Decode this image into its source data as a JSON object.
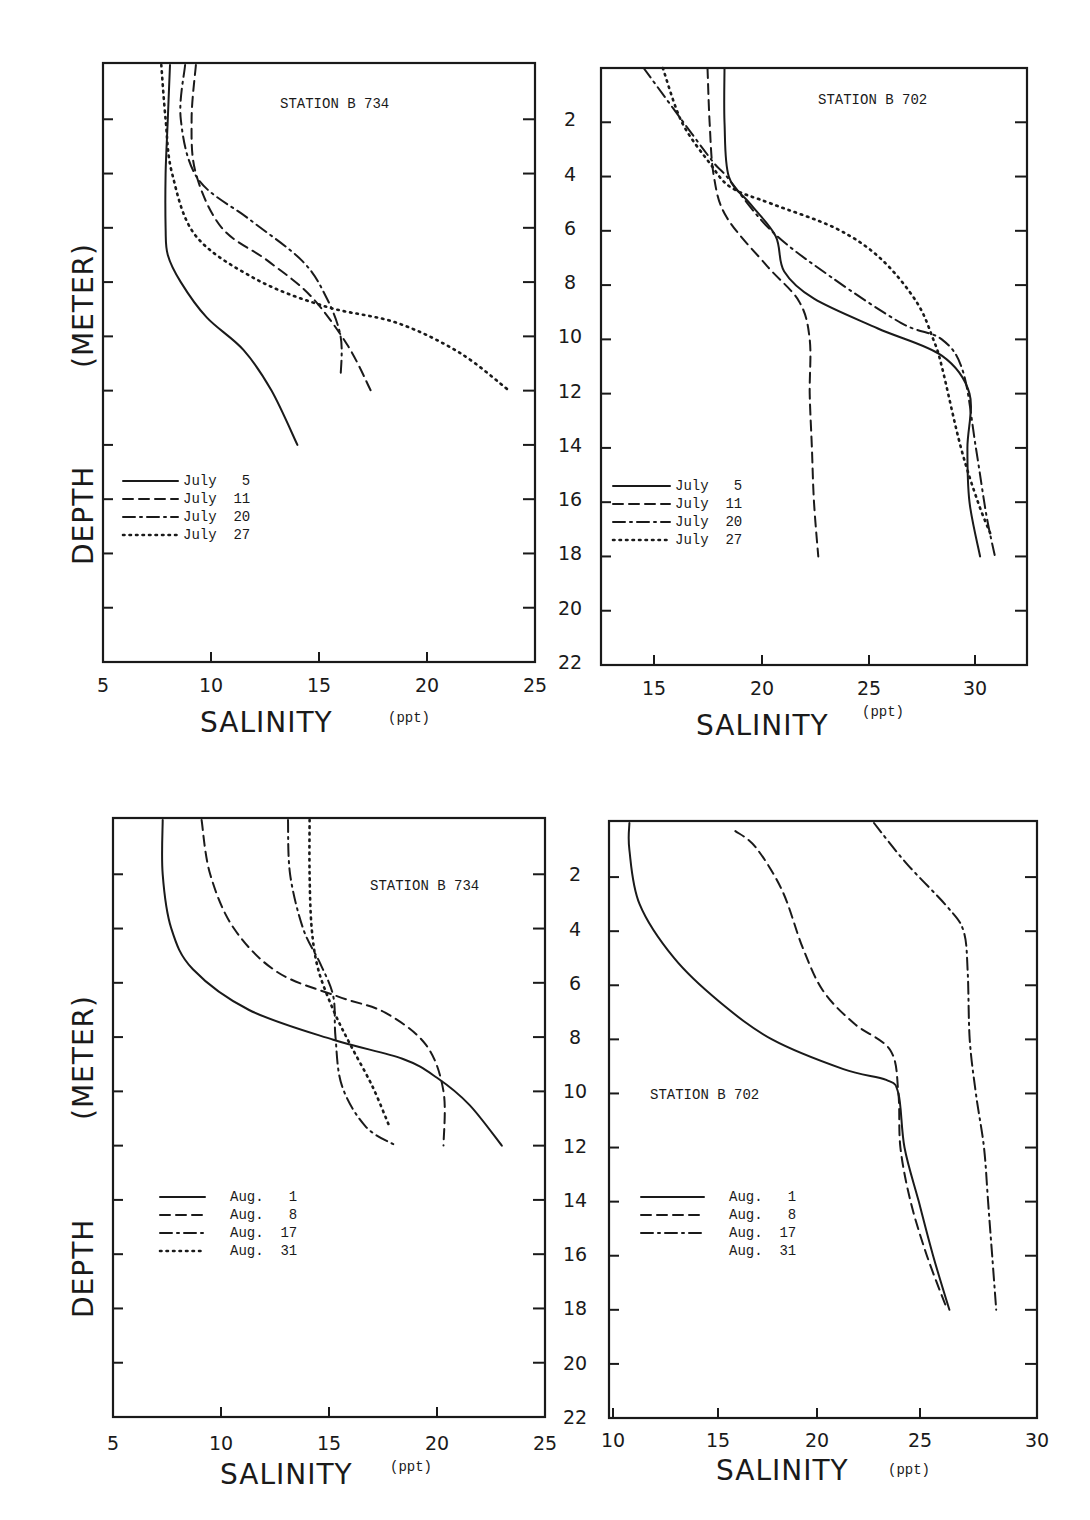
{
  "figure": {
    "y_axis_title": "DEPTH (METER)",
    "y_axis_title_parts": [
      "DEPTH",
      "(METER)"
    ],
    "shared_depth_ticks": [
      "2",
      "4",
      "6",
      "8",
      "10",
      "12",
      "14",
      "16",
      "18",
      "20",
      "22"
    ],
    "x_axis_title": "SALINITY",
    "x_axis_unit": "(ppt)"
  },
  "panels": [
    {
      "id": "top-left",
      "station_label": "STATION",
      "station_id": "B 734",
      "x_ticks": [
        "5",
        "10",
        "15",
        "20",
        "25"
      ],
      "legend": [
        {
          "label": "July",
          "day": "5",
          "style": "solid"
        },
        {
          "label": "July",
          "day": "11",
          "style": "dashed"
        },
        {
          "label": "July",
          "day": "20",
          "style": "dash-dot"
        },
        {
          "label": "July",
          "day": "27",
          "style": "dotted"
        }
      ]
    },
    {
      "id": "top-right",
      "station_label": "STATION",
      "station_id": "B 702",
      "x_ticks": [
        "15",
        "20",
        "25",
        "30"
      ],
      "legend": [
        {
          "label": "July",
          "day": "5",
          "style": "solid"
        },
        {
          "label": "July",
          "day": "11",
          "style": "dashed"
        },
        {
          "label": "July",
          "day": "20",
          "style": "dash-dot"
        },
        {
          "label": "July",
          "day": "27",
          "style": "dotted"
        }
      ]
    },
    {
      "id": "bottom-left",
      "station_label": "STATION",
      "station_id": "B 734",
      "x_ticks": [
        "5",
        "10",
        "15",
        "20",
        "25"
      ],
      "legend": [
        {
          "label": "Aug.",
          "day": "1",
          "style": "solid"
        },
        {
          "label": "Aug.",
          "day": "8",
          "style": "dashed"
        },
        {
          "label": "Aug.",
          "day": "17",
          "style": "dash-dot"
        },
        {
          "label": "Aug.",
          "day": "31",
          "style": "dotted"
        }
      ]
    },
    {
      "id": "bottom-right",
      "station_label": "STATION",
      "station_id": "B 702",
      "x_ticks": [
        "10",
        "15",
        "20",
        "25",
        "30"
      ],
      "legend": [
        {
          "label": "Aug.",
          "day": "1",
          "style": "solid"
        },
        {
          "label": "Aug.",
          "day": "8",
          "style": "dashed"
        },
        {
          "label": "Aug.",
          "day": "17",
          "style": "dash-dot"
        },
        {
          "label": "Aug.",
          "day": "31",
          "style": "none"
        }
      ]
    }
  ],
  "chart_data": [
    {
      "type": "line",
      "title": "STATION B 734 (July)",
      "xlabel": "SALINITY (ppt)",
      "ylabel": "DEPTH (METER)",
      "xlim": [
        5,
        25
      ],
      "ylim": [
        22,
        0
      ],
      "y_inverted": true,
      "grid": false,
      "legend_position": "lower-left",
      "series": [
        {
          "name": "July 5",
          "style": "solid",
          "points": [
            [
              8.1,
              0
            ],
            [
              8.0,
              2
            ],
            [
              7.9,
              4
            ],
            [
              7.9,
              6
            ],
            [
              8.0,
              7
            ],
            [
              8.6,
              8
            ],
            [
              9.8,
              9.3
            ],
            [
              11.5,
              10.5
            ],
            [
              12.8,
              12
            ],
            [
              14.0,
              14
            ]
          ]
        },
        {
          "name": "July 11",
          "style": "dashed",
          "points": [
            [
              9.3,
              0
            ],
            [
              9.1,
              2
            ],
            [
              9.3,
              4
            ],
            [
              10.5,
              6
            ],
            [
              12.6,
              7.2
            ],
            [
              14.6,
              8.5
            ],
            [
              16.3,
              10.3
            ],
            [
              17.4,
              12
            ]
          ]
        },
        {
          "name": "July 20",
          "style": "dash-dot",
          "points": [
            [
              8.8,
              0
            ],
            [
              8.6,
              2
            ],
            [
              9.4,
              4.2
            ],
            [
              11.8,
              5.7
            ],
            [
              14.2,
              7.2
            ],
            [
              15.3,
              8.5
            ],
            [
              16.0,
              10
            ],
            [
              16.0,
              11.5
            ]
          ]
        },
        {
          "name": "July 27",
          "style": "dotted",
          "points": [
            [
              7.7,
              0
            ],
            [
              7.9,
              2
            ],
            [
              8.2,
              4
            ],
            [
              9.3,
              6.3
            ],
            [
              12.1,
              7.9
            ],
            [
              15.3,
              8.9
            ],
            [
              18.6,
              9.5
            ],
            [
              21.5,
              10.6
            ],
            [
              23.8,
              12
            ]
          ]
        }
      ]
    },
    {
      "type": "line",
      "title": "STATION B 702 (July)",
      "xlabel": "SALINITY (ppt)",
      "ylabel": "DEPTH (METER)",
      "xlim": [
        12.5,
        32.5
      ],
      "ylim": [
        22,
        0
      ],
      "y_inverted": true,
      "grid": false,
      "legend_position": "lower-left",
      "series": [
        {
          "name": "July 5",
          "style": "solid",
          "points": [
            [
              18.3,
              0
            ],
            [
              18.3,
              2
            ],
            [
              18.5,
              4
            ],
            [
              19.5,
              5
            ],
            [
              20.7,
              6.2
            ],
            [
              21.1,
              7.5
            ],
            [
              22.5,
              8.5
            ],
            [
              25.5,
              9.6
            ],
            [
              28.5,
              10.6
            ],
            [
              29.8,
              12
            ],
            [
              29.7,
              14
            ],
            [
              29.8,
              16
            ],
            [
              30.3,
              18
            ]
          ]
        },
        {
          "name": "July 11",
          "style": "dashed",
          "points": [
            [
              17.5,
              0
            ],
            [
              17.6,
              2
            ],
            [
              17.8,
              4
            ],
            [
              18.4,
              5.5
            ],
            [
              20.3,
              7.3
            ],
            [
              21.8,
              8.6
            ],
            [
              22.3,
              10
            ],
            [
              22.3,
              12
            ],
            [
              22.4,
              14
            ],
            [
              22.5,
              16
            ],
            [
              22.7,
              18
            ]
          ]
        },
        {
          "name": "July 20",
          "style": "dash-dot",
          "points": [
            [
              14.5,
              0
            ],
            [
              15.9,
              1.5
            ],
            [
              17.7,
              3.4
            ],
            [
              18.4,
              4
            ],
            [
              20.5,
              6
            ],
            [
              23.3,
              7.7
            ],
            [
              26.6,
              9.4
            ],
            [
              28.5,
              10
            ],
            [
              29.5,
              11.2
            ],
            [
              30.1,
              14
            ],
            [
              30.6,
              16.5
            ],
            [
              31.0,
              18
            ]
          ]
        },
        {
          "name": "July 27",
          "style": "dotted",
          "points": [
            [
              15.4,
              0
            ],
            [
              16.3,
              2
            ],
            [
              17.6,
              3.5
            ],
            [
              18.6,
              4.4
            ],
            [
              20.5,
              5
            ],
            [
              23.5,
              5.9
            ],
            [
              25.6,
              7
            ],
            [
              27.3,
              8.6
            ],
            [
              28.1,
              10
            ],
            [
              28.5,
              11
            ],
            [
              29.4,
              14
            ],
            [
              30.2,
              16
            ],
            [
              30.8,
              17.2
            ]
          ]
        }
      ]
    },
    {
      "type": "line",
      "title": "STATION B 734 (August)",
      "xlabel": "SALINITY (ppt)",
      "ylabel": "DEPTH (METER)",
      "xlim": [
        5,
        25
      ],
      "ylim": [
        22,
        0
      ],
      "y_inverted": true,
      "grid": false,
      "legend_position": "middle-left",
      "series": [
        {
          "name": "Aug. 1",
          "style": "solid",
          "points": [
            [
              7.3,
              0
            ],
            [
              7.3,
              2
            ],
            [
              7.7,
              4
            ],
            [
              8.7,
              5.5
            ],
            [
              11.3,
              7
            ],
            [
              15.2,
              8.1
            ],
            [
              18.4,
              8.8
            ],
            [
              20.0,
              9.5
            ],
            [
              21.5,
              10.5
            ],
            [
              23.0,
              12
            ]
          ]
        },
        {
          "name": "Aug. 8",
          "style": "dashed",
          "points": [
            [
              9.1,
              0
            ],
            [
              9.5,
              2
            ],
            [
              10.6,
              4
            ],
            [
              12.6,
              5.6
            ],
            [
              15.4,
              6.5
            ],
            [
              17.6,
              7.1
            ],
            [
              19.5,
              8.3
            ],
            [
              20.3,
              10
            ],
            [
              20.3,
              12
            ]
          ]
        },
        {
          "name": "Aug. 17",
          "style": "dash-dot",
          "points": [
            [
              13.1,
              0
            ],
            [
              13.2,
              2
            ],
            [
              13.8,
              4
            ],
            [
              14.6,
              5.3
            ],
            [
              15.2,
              6.5
            ],
            [
              15.3,
              8
            ],
            [
              15.6,
              9.8
            ],
            [
              16.7,
              11.3
            ],
            [
              18.1,
              12
            ]
          ]
        },
        {
          "name": "Aug. 31",
          "style": "dotted",
          "points": [
            [
              14.1,
              0
            ],
            [
              14.1,
              2
            ],
            [
              14.2,
              4
            ],
            [
              14.5,
              5.5
            ],
            [
              15.2,
              7
            ],
            [
              16.0,
              8.3
            ],
            [
              17.0,
              9.8
            ],
            [
              17.8,
              11.3
            ]
          ]
        }
      ]
    },
    {
      "type": "line",
      "title": "STATION B 702 (August)",
      "xlabel": "SALINITY (ppt)",
      "ylabel": "DEPTH (METER)",
      "xlim": [
        10,
        31
      ],
      "ylim": [
        22,
        0
      ],
      "y_inverted": true,
      "grid": false,
      "legend_position": "lower-left",
      "series": [
        {
          "name": "Aug. 1",
          "style": "solid",
          "points": [
            [
              11.0,
              0
            ],
            [
              11.0,
              1
            ],
            [
              11.5,
              3
            ],
            [
              13.2,
              5
            ],
            [
              15.4,
              6.6
            ],
            [
              18.0,
              8.0
            ],
            [
              21.5,
              9.1
            ],
            [
              23.6,
              9.5
            ],
            [
              24.2,
              10
            ],
            [
              24.5,
              12
            ],
            [
              25.2,
              14
            ],
            [
              25.9,
              16
            ],
            [
              26.7,
              18
            ]
          ]
        },
        {
          "name": "Aug. 8",
          "style": "dashed",
          "points": [
            [
              16.2,
              0.3
            ],
            [
              17.2,
              0.9
            ],
            [
              18.5,
              2.5
            ],
            [
              19.5,
              4.6
            ],
            [
              20.5,
              6.2
            ],
            [
              22.0,
              7.4
            ],
            [
              23.8,
              8.4
            ],
            [
              24.2,
              10
            ],
            [
              24.3,
              12
            ],
            [
              24.8,
              14
            ],
            [
              25.6,
              16
            ],
            [
              26.6,
              18
            ]
          ]
        },
        {
          "name": "Aug. 17",
          "style": "dash-dot",
          "points": [
            [
              23.0,
              0
            ],
            [
              24.6,
              1.5
            ],
            [
              26.6,
              3.1
            ],
            [
              27.4,
              4
            ],
            [
              27.6,
              5.5
            ],
            [
              27.7,
              8
            ],
            [
              28.0,
              10
            ],
            [
              28.4,
              12
            ],
            [
              28.6,
              14
            ],
            [
              28.8,
              16
            ],
            [
              29.0,
              18
            ]
          ]
        }
      ]
    }
  ]
}
